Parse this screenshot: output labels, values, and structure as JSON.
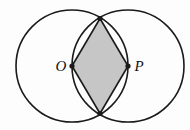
{
  "figure": {
    "background_color": "#fdfdfd",
    "stroke_color": "#1a1a1a",
    "shade_color": "#c6c6c6",
    "stroke_width": 1.6,
    "canvas": {
      "width": 190,
      "height": 130
    },
    "circles": [
      {
        "name": "circle-o",
        "center_label": "O",
        "cx": 72,
        "cy": 66,
        "r": 56,
        "fill": "none"
      },
      {
        "name": "circle-p",
        "center_label": "P",
        "cx": 128,
        "cy": 66,
        "r": 56,
        "fill": "none"
      }
    ],
    "labels": [
      {
        "name": "label-o",
        "text": "O",
        "x": 61,
        "y": 71,
        "anchor": "middle"
      },
      {
        "name": "label-p",
        "text": "P",
        "x": 139,
        "y": 71,
        "anchor": "middle"
      }
    ],
    "points": [
      {
        "name": "point-o",
        "label": "O",
        "x": 72,
        "y": 66,
        "radius": 2.6
      },
      {
        "name": "point-p",
        "label": "P",
        "x": 128,
        "y": 66,
        "radius": 2.6
      },
      {
        "name": "point-top-intersection",
        "label": "",
        "x": 100,
        "y": 18.5,
        "radius": 2.6
      },
      {
        "name": "point-bottom-intersection",
        "label": "",
        "x": 100,
        "y": 113.5,
        "radius": 2.6
      }
    ],
    "rhombus": {
      "name": "shaded-rhombus",
      "vertices": "72,66 100,18.5 128,66 100,113.5",
      "fill": "#c6c6c6",
      "description": "Rhombus O-top-P-bottom shaded gray"
    },
    "edges": [
      {
        "name": "edge-o-top",
        "x1": 72,
        "y1": 66,
        "x2": 100,
        "y2": 18.5
      },
      {
        "name": "edge-top-p",
        "x1": 100,
        "y1": 18.5,
        "x2": 128,
        "y2": 66
      },
      {
        "name": "edge-p-bottom",
        "x1": 128,
        "y1": 66,
        "x2": 100,
        "y2": 113.5
      },
      {
        "name": "edge-bottom-o",
        "x1": 100,
        "y1": 113.5,
        "x2": 72,
        "y2": 66
      }
    ]
  }
}
